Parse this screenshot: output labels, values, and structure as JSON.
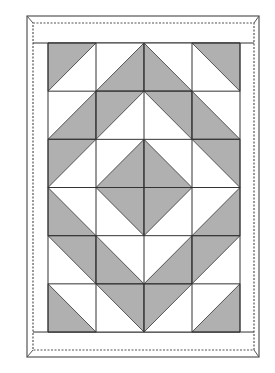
{
  "diagram": {
    "type": "quilt-pattern",
    "colors": {
      "background": "#ffffff",
      "fabric_dark": "#b0b0b0",
      "fabric_light": "#ffffff",
      "line": "#333333",
      "frame": "#555555"
    },
    "frame": {
      "outer": {
        "x": 27,
        "y": 16,
        "w": 232,
        "h": 341
      },
      "stitch": {
        "x": 33,
        "y": 23,
        "w": 221,
        "h": 327
      }
    },
    "grid": {
      "x": 48,
      "y": 43,
      "cols": 4,
      "rows": 6,
      "cell_w": 48,
      "cell_h": 48.17
    },
    "cell_legend": {
      "UL": "diagonal top-right to bottom-left, dark upper-left triangle",
      "LR": "diagonal top-right to bottom-left, dark lower-right triangle",
      "LL": "diagonal top-left to bottom-right, dark lower-left triangle",
      "UR": "diagonal top-left to bottom-right, dark upper-right triangle"
    },
    "cells": [
      [
        "UL",
        "LR",
        "LL",
        "UR"
      ],
      [
        "LR",
        "UL",
        "UR",
        "LL"
      ],
      [
        "UL",
        "LR",
        "LL",
        "UR"
      ],
      [
        "LL",
        "UR",
        "UL",
        "LR"
      ],
      [
        "UR",
        "LL",
        "LR",
        "UL"
      ],
      [
        "LL",
        "UR",
        "UL",
        "LR"
      ]
    ]
  }
}
